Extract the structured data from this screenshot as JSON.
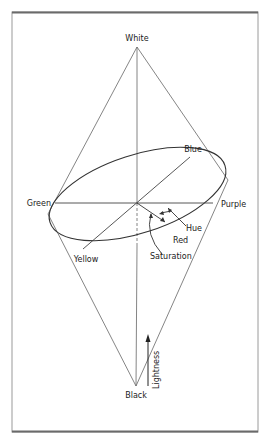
{
  "diagram": {
    "type": "color-solid",
    "labels": {
      "top": "White",
      "bottom": "Black",
      "hue_blue": "Blue",
      "hue_green": "Green",
      "hue_purple": "Purple",
      "hue_yellow": "Yellow",
      "hue_red": "Red",
      "hue_dimension": "Hue",
      "saturation_dimension": "Saturation",
      "lightness_dimension": "Lightness"
    },
    "colors": {
      "frame_top": "#6a6a6a",
      "frame": "#9a9a9a",
      "line": "#555555",
      "ellipse": "#333333",
      "text": "#222222"
    }
  }
}
